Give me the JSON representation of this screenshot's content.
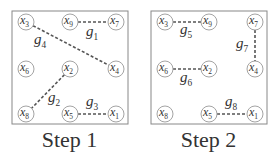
{
  "panels": [
    {
      "caption": "Step 1",
      "nodes": [
        {
          "id": "x3",
          "label": "x",
          "sub": "3",
          "cx": 26,
          "cy": 22
        },
        {
          "id": "x9",
          "label": "x",
          "sub": "9",
          "cx": 70,
          "cy": 22
        },
        {
          "id": "x7",
          "label": "x",
          "sub": "7",
          "cx": 116,
          "cy": 22
        },
        {
          "id": "x6",
          "label": "x",
          "sub": "6",
          "cx": 26,
          "cy": 69
        },
        {
          "id": "x2",
          "label": "x",
          "sub": "2",
          "cx": 70,
          "cy": 69
        },
        {
          "id": "x4",
          "label": "x",
          "sub": "4",
          "cx": 116,
          "cy": 69
        },
        {
          "id": "x8",
          "label": "x",
          "sub": "8",
          "cx": 26,
          "cy": 114
        },
        {
          "id": "x5",
          "label": "x",
          "sub": "5",
          "cx": 70,
          "cy": 114
        },
        {
          "id": "x1",
          "label": "x",
          "sub": "1",
          "cx": 116,
          "cy": 114
        }
      ],
      "edges": [
        {
          "from": "x9",
          "to": "x7",
          "label": "g",
          "sub": "1",
          "lx": 86,
          "ly": 36
        },
        {
          "from": "x2",
          "to": "x8",
          "label": "g",
          "sub": "2",
          "lx": 48,
          "ly": 102
        },
        {
          "from": "x5",
          "to": "x1",
          "label": "g",
          "sub": "3",
          "lx": 86,
          "ly": 106
        },
        {
          "from": "x3",
          "to": "x4",
          "label": "g",
          "sub": "4",
          "lx": 34,
          "ly": 44
        }
      ]
    },
    {
      "caption": "Step 2",
      "nodes": [
        {
          "id": "x3",
          "label": "x",
          "sub": "3",
          "cx": 26,
          "cy": 22
        },
        {
          "id": "x9",
          "label": "x",
          "sub": "9",
          "cx": 70,
          "cy": 22
        },
        {
          "id": "x7",
          "label": "x",
          "sub": "7",
          "cx": 116,
          "cy": 22
        },
        {
          "id": "x6",
          "label": "x",
          "sub": "6",
          "cx": 26,
          "cy": 69
        },
        {
          "id": "x2",
          "label": "x",
          "sub": "2",
          "cx": 70,
          "cy": 69
        },
        {
          "id": "x4",
          "label": "x",
          "sub": "4",
          "cx": 116,
          "cy": 69
        },
        {
          "id": "x8",
          "label": "x",
          "sub": "8",
          "cx": 26,
          "cy": 114
        },
        {
          "id": "x5",
          "label": "x",
          "sub": "5",
          "cx": 70,
          "cy": 114
        },
        {
          "id": "x1",
          "label": "x",
          "sub": "1",
          "cx": 116,
          "cy": 114
        }
      ],
      "edges": [
        {
          "from": "x3",
          "to": "x9",
          "label": "g",
          "sub": "5",
          "lx": 41,
          "ly": 34
        },
        {
          "from": "x6",
          "to": "x2",
          "label": "g",
          "sub": "6",
          "lx": 41,
          "ly": 82
        },
        {
          "from": "x7",
          "to": "x4",
          "label": "g",
          "sub": "7",
          "lx": 97,
          "ly": 48
        },
        {
          "from": "x5",
          "to": "x1",
          "label": "g",
          "sub": "8",
          "lx": 86,
          "ly": 106
        }
      ]
    }
  ],
  "colors": {
    "stroke": "#555555",
    "box": "#888888",
    "text": "#333333"
  }
}
